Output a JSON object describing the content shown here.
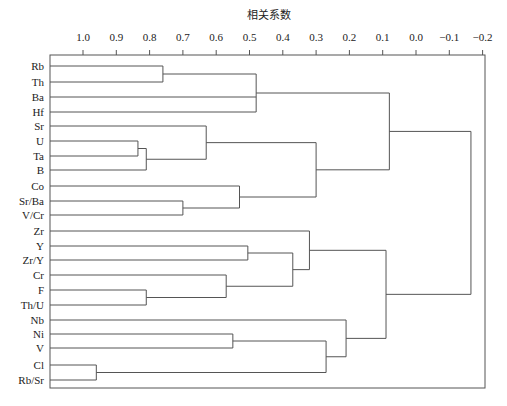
{
  "chart_data": {
    "type": "dendrogram",
    "title": "相关系数",
    "xlabel": "相关系数",
    "ylabel": "",
    "x_axis": {
      "position": "top",
      "ticks": [
        1.0,
        0.9,
        0.8,
        0.7,
        0.6,
        0.5,
        0.4,
        0.3,
        0.2,
        0.1,
        0.0,
        -0.1,
        -0.2
      ],
      "tick_labels": [
        "1.0",
        "0.9",
        "0.8",
        "0.7",
        "0.6",
        "0.5",
        "0.4",
        "0.3",
        "0.2",
        "0.1",
        "0.0",
        "−0.1",
        "−0.2"
      ],
      "range": [
        1.0,
        -0.2
      ]
    },
    "leaves": [
      "Rb",
      "Th",
      "Ba",
      "Hf",
      "Sr",
      "U",
      "Ta",
      "B",
      "Co",
      "Sr/Ba",
      "V/Cr",
      "Zr",
      "Y",
      "Zr/Y",
      "Cr",
      "F",
      "Th/U",
      "Nb",
      "Ni",
      "V",
      "Cl",
      "Rb/Sr"
    ],
    "merges": [
      {
        "id": "m1",
        "children": [
          "Rb",
          "Th"
        ],
        "similarity": 0.76
      },
      {
        "id": "m2",
        "children": [
          "m1",
          "Ba",
          "Hf"
        ],
        "similarity": 0.48
      },
      {
        "id": "m3",
        "children": [
          "U",
          "Ta"
        ],
        "similarity": 0.835
      },
      {
        "id": "m4",
        "children": [
          "m3",
          "B"
        ],
        "similarity": 0.81
      },
      {
        "id": "m5",
        "children": [
          "Sr",
          "m4"
        ],
        "similarity": 0.63
      },
      {
        "id": "m6",
        "children": [
          "Sr/Ba",
          "V/Cr"
        ],
        "similarity": 0.7
      },
      {
        "id": "m7",
        "children": [
          "Co",
          "m6"
        ],
        "similarity": 0.53
      },
      {
        "id": "m8",
        "children": [
          "m5",
          "m7"
        ],
        "similarity": 0.3
      },
      {
        "id": "m9",
        "children": [
          "m2",
          "m8"
        ],
        "similarity": 0.08
      },
      {
        "id": "m10",
        "children": [
          "Y",
          "Zr/Y"
        ],
        "similarity": 0.505
      },
      {
        "id": "m11",
        "children": [
          "F",
          "Th/U"
        ],
        "similarity": 0.81
      },
      {
        "id": "m12",
        "children": [
          "Cr",
          "m11"
        ],
        "similarity": 0.57
      },
      {
        "id": "m13",
        "children": [
          "m10",
          "m12"
        ],
        "similarity": 0.37
      },
      {
        "id": "m14",
        "children": [
          "Zr",
          "m13"
        ],
        "similarity": 0.32
      },
      {
        "id": "m15",
        "children": [
          "Ni",
          "V"
        ],
        "similarity": 0.55
      },
      {
        "id": "m16",
        "children": [
          "Cl",
          "Rb/Sr"
        ],
        "similarity": 0.96
      },
      {
        "id": "m17",
        "children": [
          "m15",
          "m16"
        ],
        "similarity": 0.27
      },
      {
        "id": "m18",
        "children": [
          "Nb",
          "m17"
        ],
        "similarity": 0.21
      },
      {
        "id": "m19",
        "children": [
          "m14",
          "m18"
        ],
        "similarity": 0.09
      },
      {
        "id": "m20",
        "children": [
          "m9",
          "m19"
        ],
        "similarity": -0.165
      }
    ],
    "grid": false,
    "legend": null
  },
  "layout": {
    "axis_x_at_1": 83,
    "axis_px_per_unit": 333,
    "box": {
      "left": 50,
      "top": 55,
      "right": 485,
      "bottom": 388
    },
    "leaf_y": [
      66,
      82,
      97,
      112,
      126,
      141,
      156,
      170,
      186,
      201,
      215,
      231,
      246,
      260,
      275,
      290,
      305,
      320,
      334,
      348,
      365,
      380
    ],
    "line_color": "#555555"
  }
}
